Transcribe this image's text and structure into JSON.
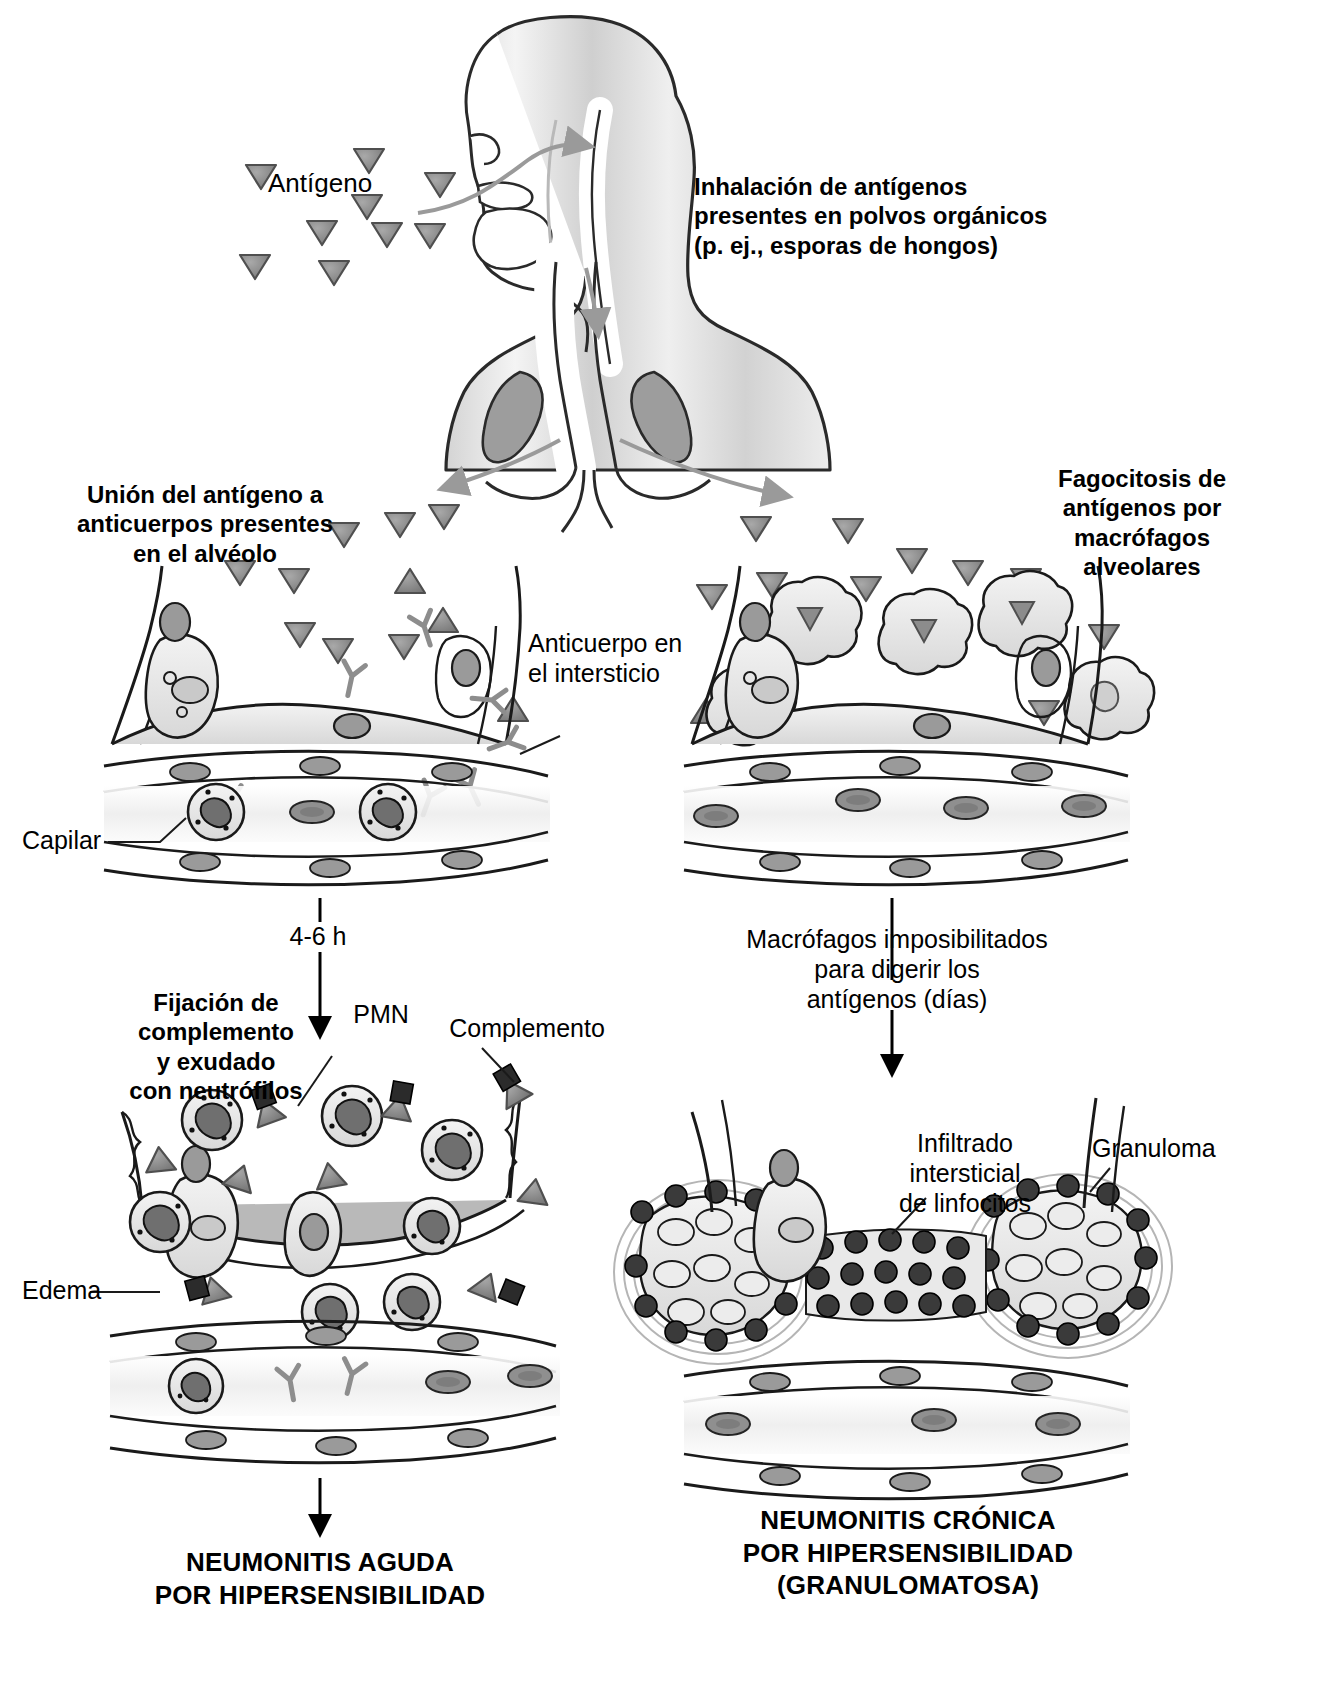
{
  "figure": {
    "title_implicit": "Patogenia de la neumonitis por hipersensibilidad",
    "language": "es"
  },
  "colors": {
    "ink": "#000000",
    "antigen_fill": "#8a8a8a",
    "antigen_stroke": "#4a4a4a",
    "cell_fill": "#e3e3e3",
    "cell_stroke": "#1a1a1a",
    "nucleus_fill": "#9a9a9a",
    "lymphocyte_fill": "#3a3a3a",
    "antibody_stroke": "#8a8a8a",
    "complement_fill": "#2b2b2b",
    "body_gradient_light": "#f2f2f2",
    "body_gradient_dark": "#c9c9c9",
    "arrow_gray": "#9a9a9a",
    "edema_fill": "#d0d0d0"
  },
  "labels": {
    "antigen": "Antígeno",
    "inhalation": "Inhalación de antígenos\npresentes en polvos orgánicos\n(p. ej., esporas de hongos)",
    "left_branch_heading": "Unión del antígeno a\nanticuerpos presentes\nen el alvéolo",
    "right_branch_heading": "Fagocitosis de\nantígenos por\nmacrófagos\nalveolares",
    "antibody_interstitium": "Anticuerpo en\nel intersticio",
    "capillary": "Capilar",
    "time_4_6h": "4-6 h",
    "macrophages_unable": "Macrófagos imposibilitados\npara digerir los\nantígenos (días)",
    "complement_fixation": "Fijación de\ncomplemento\ny exudado\ncon neutrófilos",
    "pmn": "PMN",
    "complement": "Complemento",
    "edema": "Edema",
    "lymphocytic_infiltrate": "Infiltrado\nintersticial\nde linfocitos",
    "granuloma": "Granuloma",
    "outcome_acute": "NEUMONITIS AGUDA\nPOR HIPERSENSIBILIDAD",
    "outcome_chronic": "NEUMONITIS CRÓNICA\nPOR HIPERSENSIBILIDAD\n(GRANULOMATOSA)"
  },
  "icons": {
    "antigen": "triangle-icon",
    "antibody": "y-shaped-antibody-icon",
    "complement": "complement-wedge-icon",
    "macrophage": "macrophage-cell-icon",
    "neutrophil": "pmn-neutrophil-icon",
    "lymphocyte": "lymphocyte-dot-icon",
    "erythrocyte": "red-blood-cell-icon",
    "arrow_down": "arrow-down-icon",
    "arrow_curved": "curved-arrow-icon",
    "leader_line": "leader-line-icon",
    "head_torso": "human-head-torso-icon",
    "airway": "airway-trachea-icon",
    "lungs": "lungs-icon"
  },
  "panels": [
    {
      "id": "top",
      "name": "inhalation-panel"
    },
    {
      "id": "left-acute",
      "name": "acute-pathway-panel"
    },
    {
      "id": "right-chronic",
      "name": "chronic-pathway-panel"
    }
  ]
}
